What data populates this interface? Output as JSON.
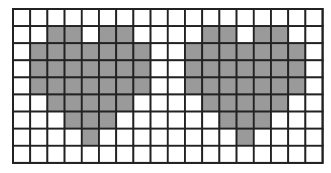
{
  "figure": {
    "rows": 9,
    "cols": 18,
    "colors": {
      "filled": "#9a9a9a",
      "empty": "#ffffff",
      "grid_line": "#222222"
    },
    "shapes": [
      {
        "name": "left-heart",
        "cells": [
          [
            1,
            2
          ],
          [
            1,
            3
          ],
          [
            1,
            5
          ],
          [
            1,
            6
          ],
          [
            2,
            1
          ],
          [
            2,
            2
          ],
          [
            2,
            3
          ],
          [
            2,
            4
          ],
          [
            2,
            5
          ],
          [
            2,
            6
          ],
          [
            2,
            7
          ],
          [
            3,
            1
          ],
          [
            3,
            2
          ],
          [
            3,
            3
          ],
          [
            3,
            4
          ],
          [
            3,
            5
          ],
          [
            3,
            6
          ],
          [
            3,
            7
          ],
          [
            4,
            1
          ],
          [
            4,
            2
          ],
          [
            4,
            3
          ],
          [
            4,
            4
          ],
          [
            4,
            5
          ],
          [
            4,
            6
          ],
          [
            4,
            7
          ],
          [
            5,
            2
          ],
          [
            5,
            3
          ],
          [
            5,
            4
          ],
          [
            5,
            5
          ],
          [
            5,
            6
          ],
          [
            6,
            3
          ],
          [
            6,
            4
          ],
          [
            6,
            5
          ],
          [
            7,
            4
          ]
        ]
      },
      {
        "name": "right-heart",
        "cells": [
          [
            1,
            11
          ],
          [
            1,
            12
          ],
          [
            1,
            14
          ],
          [
            1,
            15
          ],
          [
            2,
            10
          ],
          [
            2,
            11
          ],
          [
            2,
            12
          ],
          [
            2,
            13
          ],
          [
            2,
            14
          ],
          [
            2,
            15
          ],
          [
            2,
            16
          ],
          [
            3,
            10
          ],
          [
            3,
            11
          ],
          [
            3,
            12
          ],
          [
            3,
            13
          ],
          [
            3,
            14
          ],
          [
            3,
            15
          ],
          [
            3,
            16
          ],
          [
            4,
            10
          ],
          [
            4,
            11
          ],
          [
            4,
            12
          ],
          [
            4,
            13
          ],
          [
            4,
            14
          ],
          [
            4,
            15
          ],
          [
            4,
            16
          ],
          [
            5,
            11
          ],
          [
            5,
            12
          ],
          [
            5,
            13
          ],
          [
            5,
            14
          ],
          [
            5,
            15
          ],
          [
            6,
            12
          ],
          [
            6,
            13
          ],
          [
            6,
            14
          ],
          [
            7,
            13
          ]
        ]
      }
    ]
  }
}
